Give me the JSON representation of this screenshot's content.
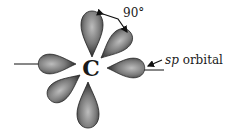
{
  "diagram": {
    "center_atom": "C",
    "angle_label": "90°",
    "orbital_label_italic": "sp",
    "orbital_label_rest": " orbital",
    "lobe_count": 6,
    "colors": {
      "lobe_dark": "#2a2a2a",
      "lobe_light": "#9a9a9a",
      "line": "#111111"
    }
  }
}
